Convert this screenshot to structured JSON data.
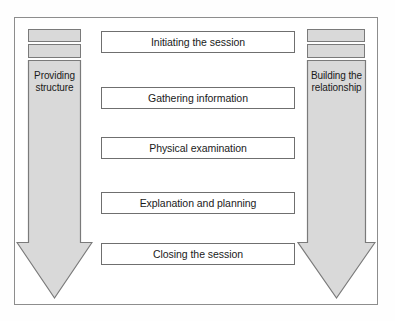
{
  "diagram": {
    "colors": {
      "arrow_fill": "#d9d9d9",
      "arrow_stroke": "#7a7a7a",
      "box_fill": "#ffffff",
      "box_stroke": "#6f6f6f",
      "frame_stroke": "#8d8d8d",
      "text": "#1a1a1a",
      "background": "#ffffff"
    },
    "left_column": {
      "name": "providing-structure",
      "label": "Providing\nstructure",
      "mini_bars": [
        {
          "name": "left-mini-bar-top"
        },
        {
          "name": "left-mini-bar-second"
        }
      ]
    },
    "right_column": {
      "name": "building-the-relationship",
      "label": "Building the\nrelationship",
      "mini_bars": [
        {
          "name": "right-mini-bar-top"
        },
        {
          "name": "right-mini-bar-second"
        }
      ]
    },
    "stages": [
      {
        "id": "initiating-the-session",
        "label": "Initiating the session"
      },
      {
        "id": "gathering-information",
        "label": "Gathering information"
      },
      {
        "id": "physical-examination",
        "label": "Physical examination"
      },
      {
        "id": "explanation-and-planning",
        "label": "Explanation and planning"
      },
      {
        "id": "closing-the-session",
        "label": "Closing the session"
      }
    ]
  }
}
